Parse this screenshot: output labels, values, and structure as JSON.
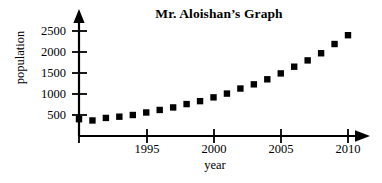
{
  "chart_data": {
    "type": "scatter",
    "title": "Mr. Aloishan’s Graph",
    "xlabel": "year",
    "ylabel": "population",
    "xlim": [
      1990,
      2011
    ],
    "ylim": [
      0,
      2650
    ],
    "grid": false,
    "legend": null,
    "xticks": [
      1995,
      2000,
      2005,
      2010
    ],
    "xtick_labels": [
      "1995",
      "2000",
      "2005",
      "2010"
    ],
    "yticks": [
      500,
      1000,
      1500,
      2000,
      2500
    ],
    "ytick_labels": [
      "500",
      "1000",
      "1500",
      "2000",
      "2500"
    ],
    "marker": "square",
    "marker_color": "#000000",
    "x": [
      1990,
      1991,
      1992,
      1993,
      1994,
      1995,
      1996,
      1997,
      1998,
      1999,
      2000,
      2001,
      2002,
      2003,
      2004,
      2005,
      2006,
      2007,
      2008,
      2009,
      2010
    ],
    "values": [
      400,
      370,
      430,
      460,
      500,
      560,
      620,
      680,
      760,
      830,
      920,
      1010,
      1130,
      1230,
      1350,
      1490,
      1650,
      1800,
      1970,
      2190,
      2400
    ]
  },
  "axes": {
    "x_axis_name": "year-axis",
    "y_axis_name": "population-axis",
    "x_arrow": "right-arrow-icon",
    "y_arrow": "up-arrow-icon"
  }
}
